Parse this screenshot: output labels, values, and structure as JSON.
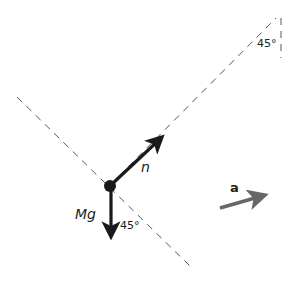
{
  "diagram": {
    "labels": {
      "normal_force": "n",
      "weight": "Mg",
      "acceleration": "a",
      "angle_bottom": "45°",
      "angle_top": "45°"
    },
    "colors": {
      "force_arrows": "#1a1a1a",
      "acceleration_arrow": "#666666",
      "dashed_lines": "#555555"
    }
  }
}
